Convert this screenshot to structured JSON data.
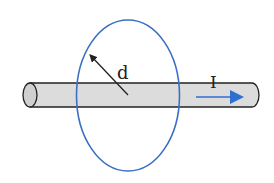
{
  "diagram": {
    "labels": {
      "distance": "d",
      "current": "I"
    },
    "colors": {
      "loop": "#3a6fc4",
      "current_arrow": "#2f6fd0",
      "wire_fill": "#dcdcdc",
      "wire_outline": "#222222",
      "text": "#222222"
    },
    "elements": [
      {
        "id": "wire",
        "kind": "cylinder",
        "description": "Horizontal cylindrical conductor"
      },
      {
        "id": "loop",
        "kind": "ellipse",
        "description": "Circular loop around the wire (perspective ellipse)"
      },
      {
        "id": "radius-arrow",
        "kind": "arrow",
        "description": "Arrow from wire axis to loop indicating distance d"
      },
      {
        "id": "current-arrow",
        "kind": "arrow",
        "description": "Blue arrow along the wire indicating current I direction"
      }
    ]
  }
}
